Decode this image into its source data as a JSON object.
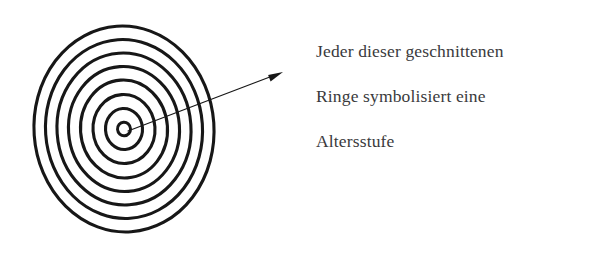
{
  "figure": {
    "kind": "concentric-rings-diagram",
    "background_color": "#ffffff",
    "ink_color": "#171717",
    "rings": {
      "label": "concentric cut tree rings",
      "center_x": 124,
      "center_y": 129,
      "count": 8,
      "stroke_width": 3.1,
      "radii_x": [
        90,
        78.5,
        67,
        55.5,
        43.5,
        31,
        18.5,
        6.5
      ],
      "radii_y": [
        103,
        89.5,
        76,
        62.5,
        49,
        34.5,
        20.5,
        6.8
      ],
      "rotation_deg": -4
    },
    "arrow": {
      "label": "pointer from ring centre to caption",
      "from_x": 128,
      "from_y": 131,
      "to_x": 283,
      "to_y": 72,
      "stroke_width": 1.2,
      "head_length": 15,
      "head_width": 9
    }
  },
  "annotation": {
    "name": "caption",
    "text_color": "#3a3a3c",
    "lines": [
      "Jeder dieser geschnittenen",
      "Ringe symbolisiert eine",
      "Altersstufe"
    ]
  }
}
